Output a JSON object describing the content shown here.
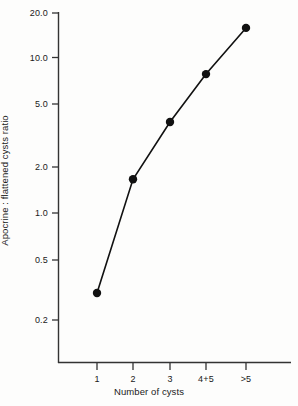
{
  "chart_data": {
    "type": "line",
    "title": "",
    "subtitle": "",
    "xlabel": "Number of cysts",
    "ylabel": "Apocrine : flattened cysts ratio",
    "categories": [
      "1",
      "2",
      "3",
      "4+5",
      ">5"
    ],
    "values": [
      0.3,
      1.65,
      3.9,
      8.0,
      16.0
    ],
    "series": [
      {
        "name": "Apocrine : flattened cysts ratio",
        "values": [
          0.3,
          1.65,
          3.9,
          8.0,
          16.0
        ]
      }
    ],
    "yscale": "log",
    "ylim": [
      0.2,
      20.0
    ],
    "ytick_labels": [
      "20.0",
      "10.0",
      "5.0",
      "2.0",
      "1.0",
      "0.5",
      "0.2"
    ],
    "ytick_values": [
      20.0,
      10.0,
      5.0,
      2.0,
      1.0,
      0.5,
      0.2
    ],
    "xtick_labels": [
      "1",
      "2",
      "3",
      "4+5",
      ">5"
    ],
    "grid": false,
    "legend": false,
    "legend_position": "none",
    "marker": "filled-circle",
    "marker_color": "#111111",
    "line_color": "#111111",
    "axis_color": "#333333",
    "background_color": "#fdfdfc",
    "annotations": []
  },
  "axes": {
    "y_title": "Apocrine : flattened cysts ratio",
    "x_title": "Number of cysts",
    "y_ticks": [
      {
        "label": "20.0",
        "value": 20.0
      },
      {
        "label": "10.0",
        "value": 10.0
      },
      {
        "label": "5.0",
        "value": 5.0
      },
      {
        "label": "2.0",
        "value": 2.0
      },
      {
        "label": "1.0",
        "value": 1.0
      },
      {
        "label": "0.5",
        "value": 0.5
      },
      {
        "label": "0.2",
        "value": 0.2
      }
    ],
    "x_ticks": [
      {
        "label": "1"
      },
      {
        "label": "2"
      },
      {
        "label": "3"
      },
      {
        "label": "4+5"
      },
      {
        "label": ">5"
      }
    ]
  }
}
